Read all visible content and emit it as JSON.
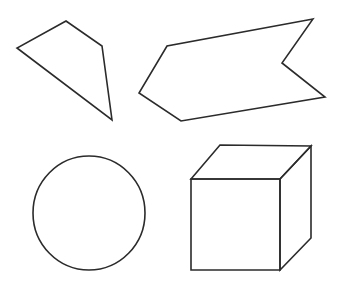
{
  "canvas": {
    "width": 339,
    "height": 287,
    "background_color": "#ffffff",
    "stroke_color": "#2b2b2b",
    "stroke_width": 1.6,
    "fill": "none"
  },
  "figure": {
    "shape_count": 4
  },
  "shapes": [
    {
      "id": "quadrilateral",
      "name": "irregular-quadrilateral",
      "label": "Irregular quadrilateral (kite-like)",
      "position": "top-left",
      "type": "polygon",
      "closed": true,
      "vertex_count": 4,
      "points": "66,21 102,46 112,120 17,48",
      "vertices": [
        {
          "x": 66,
          "y": 21
        },
        {
          "x": 102,
          "y": 46
        },
        {
          "x": 112,
          "y": 120
        },
        {
          "x": 17,
          "y": 48
        }
      ]
    },
    {
      "id": "chevron",
      "name": "chevron-arrow-polygon",
      "label": "Concave arrow / chevron banner polygon",
      "position": "top-right",
      "type": "polygon",
      "closed": true,
      "vertex_count": 6,
      "points": "313,19 167,46 139,93 181,121 325,97 282,63",
      "vertices": [
        {
          "x": 313,
          "y": 19
        },
        {
          "x": 167,
          "y": 46
        },
        {
          "x": 139,
          "y": 93
        },
        {
          "x": 181,
          "y": 121
        },
        {
          "x": 325,
          "y": 97
        },
        {
          "x": 282,
          "y": 63
        }
      ]
    },
    {
      "id": "circle",
      "name": "circle-outline",
      "label": "Circle",
      "position": "bottom-left",
      "type": "ellipse",
      "closed": true,
      "center": {
        "x": 89,
        "y": 213
      },
      "radius_x": 56,
      "radius_y": 57
    },
    {
      "id": "cube",
      "name": "cube-wireframe",
      "label": "Cube drawn in perspective",
      "position": "bottom-right",
      "type": "composite",
      "vertices": {
        "front_top_left": {
          "x": 191,
          "y": 179
        },
        "front_top_right": {
          "x": 280,
          "y": 179
        },
        "front_bottom_right": {
          "x": 280,
          "y": 270
        },
        "front_bottom_left": {
          "x": 191,
          "y": 270
        },
        "back_top_left": {
          "x": 220,
          "y": 145
        },
        "back_top_right": {
          "x": 311,
          "y": 146
        },
        "back_bottom_right": {
          "x": 311,
          "y": 238
        }
      },
      "faces": [
        {
          "name": "front-face",
          "points": "191,179 280,179 280,270 191,270"
        },
        {
          "name": "top-face",
          "points": "191,179 220,145 311,146 280,179"
        },
        {
          "name": "right-face",
          "points": "280,179 311,146 311,238 280,270"
        }
      ]
    }
  ]
}
